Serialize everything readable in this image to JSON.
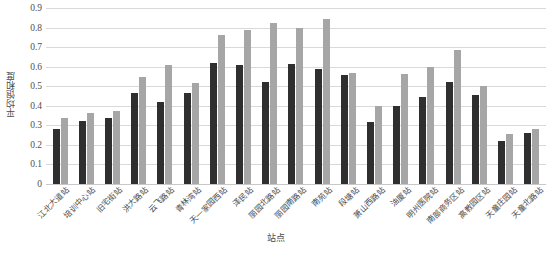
{
  "chart_data": {
    "type": "bar",
    "title": "",
    "xlabel": "站点",
    "ylabel": "平均饱和度",
    "ylim": [
      0,
      0.9
    ],
    "ytick_labels": [
      "0.9",
      "0.8",
      "0.7",
      "0.6",
      "0.5",
      "0.4",
      "0.3",
      "0.2",
      "0.1",
      "0"
    ],
    "ytick_values": [
      0.9,
      0.8,
      0.7,
      0.6,
      0.5,
      0.4,
      0.3,
      0.2,
      0.1,
      0
    ],
    "grid": true,
    "legend_position": "none",
    "bar_colors": [
      "#2f2f2f",
      "#a6a6a6"
    ],
    "categories": [
      "江北大道站",
      "培训中心站",
      "旧宅街站",
      "洪大路站",
      "云飞路站",
      "青林湾站",
      "天一家园西站",
      "泽民站",
      "丽园北路站",
      "丽园南路站",
      "南苑站",
      "段塘站",
      "萧山西路站",
      "油厦站",
      "明州医院站",
      "南部商务区站",
      "高教园区站",
      "天童庄园站",
      "天童北路站"
    ],
    "series": [
      {
        "name": "系列1",
        "color": "#2f2f2f",
        "values": [
          0.28,
          0.32,
          0.34,
          0.465,
          0.42,
          0.465,
          0.62,
          0.61,
          0.52,
          0.615,
          0.59,
          0.555,
          0.315,
          0.4,
          0.445,
          0.52,
          0.455,
          0.22,
          0.26
        ]
      },
      {
        "name": "系列2",
        "color": "#a6a6a6",
        "values": [
          0.34,
          0.365,
          0.375,
          0.545,
          0.61,
          0.515,
          0.76,
          0.79,
          0.825,
          0.8,
          0.845,
          0.57,
          0.4,
          0.565,
          0.6,
          0.685,
          0.5,
          0.255,
          0.28
        ]
      }
    ]
  }
}
